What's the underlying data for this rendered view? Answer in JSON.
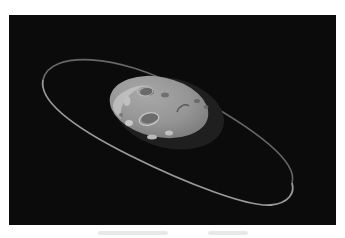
{
  "scene": {
    "description": "Cratered gray asteroid orbited by a thin tilted ring on a black starless background",
    "background_color": "#0b0b0b",
    "page_color": "#ffffff",
    "asteroid": {
      "light_color": "#9a9a9a",
      "highlight_color": "#c8c8c8",
      "shadow_color": "#2a2a2a",
      "crater_color": "#6e6e6e"
    },
    "ring": {
      "color": "#8a8a8a"
    }
  },
  "caption": {
    "visible": true,
    "legible": false
  }
}
